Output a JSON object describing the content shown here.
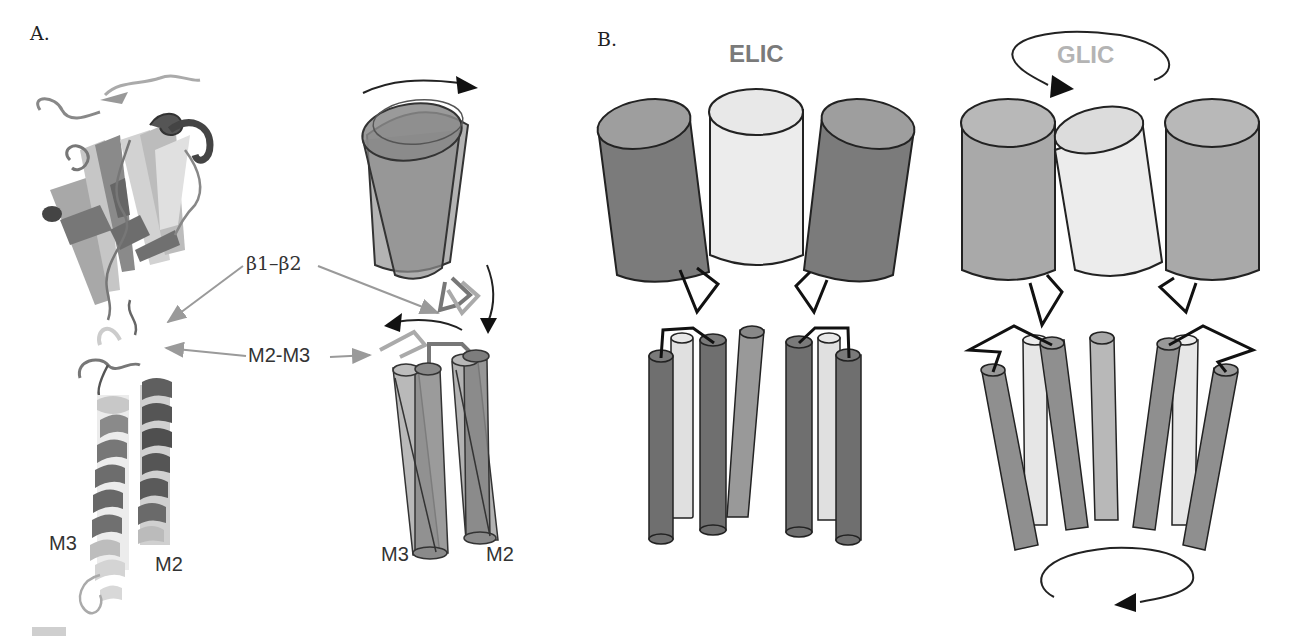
{
  "figure": {
    "panel_a": {
      "label": "A.",
      "structure_labels": {
        "m3": "M3",
        "m2": "M2"
      },
      "annotations": {
        "beta_loop": "β1–β2",
        "m2m3_loop": "M2-M3"
      },
      "schematic_labels": {
        "m3": "M3",
        "m2": "M2"
      }
    },
    "panel_b": {
      "label": "B.",
      "elic": {
        "title": "ELIC",
        "title_color": "#7a7a7a"
      },
      "glic": {
        "title": "GLIC",
        "title_color": "#b4b4b4"
      }
    },
    "caption": {
      "text": ""
    },
    "colors": {
      "dark_helix": "#6f6f6f",
      "mid_helix": "#9a9a9a",
      "light_helix": "#e6e6e6",
      "glic_mid": "#a9a9a9",
      "outline": "#222222",
      "arrow_gray": "#9a9a9a"
    }
  }
}
